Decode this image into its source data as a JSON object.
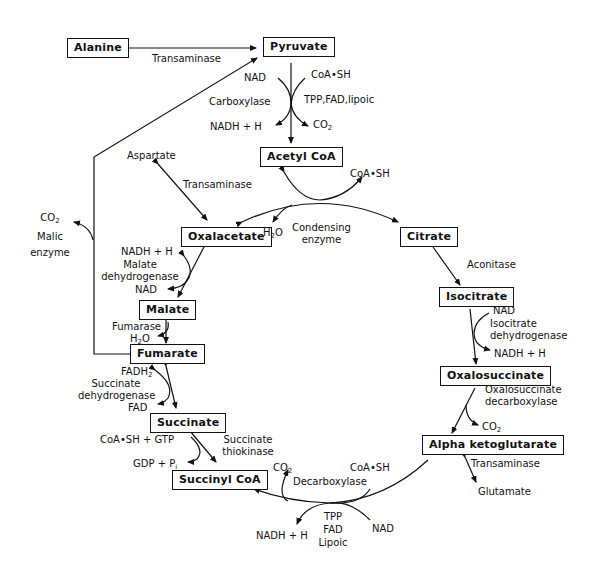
{
  "compounds": {
    "alanine": "Alanine",
    "pyruvate": "Pyruvate",
    "acetyl_coa": "Acetyl CoA",
    "oxalacetate": "Oxalacetate",
    "citrate": "Citrate",
    "isocitrate": "Isocitrate",
    "oxalosuccinate": "Oxalosuccinate",
    "alpha_ketoglutarate": "Alpha ketoglutarate",
    "succinyl_coa": "Succinyl CoA",
    "succinate": "Succinate",
    "fumarate": "Fumarate",
    "malate": "Malate"
  },
  "labels": {
    "transaminase_alanine": "Transaminase",
    "pdh_nad": "NAD",
    "pdh_coash": "CoA•SH",
    "pdh_carboxylase": "Carboxylase",
    "pdh_cofactors": "TPP,FAD,lipoic",
    "pdh_nadh": "NADH + H",
    "pdh_co2": "CO",
    "aspartate": "Aspartate",
    "transaminase_aspartate": "Transaminase",
    "cs_coash": "CoA•SH",
    "cs_h2o": "H",
    "cs_enzyme_1": "Condensing",
    "cs_enzyme_2": "enzyme",
    "malic_co2": "CO",
    "malic_1": "Malic",
    "malic_2": "enzyme",
    "mdh_nadh": "NADH + H",
    "mdh_1": "Malate",
    "mdh_2": "dehydrogenase",
    "mdh_nad": "NAD",
    "aconitase": "Aconitase",
    "idh_nad": "NAD",
    "idh_1": "Isocitrate",
    "idh_2": "dehydrogenase",
    "idh_nadh": "NADH + H",
    "osd_1": "Oxalosuccinate",
    "osd_2": "decarboxylase",
    "osd_co2": "CO",
    "transaminase_glutamate": "Transaminase",
    "glutamate": "Glutamate",
    "fumarase": "Fumarase",
    "fum_h2o": "H",
    "sdh_fadh2": "FADH",
    "sdh_1": "Succinate",
    "sdh_2": "dehydrogenase",
    "sdh_fad": "FAD",
    "stk_coash_gtp": "CoA•SH + GTP",
    "stk_gdp": "GDP + P",
    "stk_1": "Succinate",
    "stk_2": "thiokinase",
    "akdh_co2": "CO",
    "akdh_coash": "CoA•SH",
    "akdh_decarboxylase": "Decarboxylase",
    "akdh_tpp": "TPP",
    "akdh_fad": "FAD",
    "akdh_lipoic": "Lipoic",
    "akdh_nadh": "NADH + H",
    "akdh_nad": "NAD"
  },
  "subscripts": {
    "two": "2",
    "i": "i"
  },
  "colors": {
    "ink": "#111111",
    "background": "#ffffff"
  }
}
